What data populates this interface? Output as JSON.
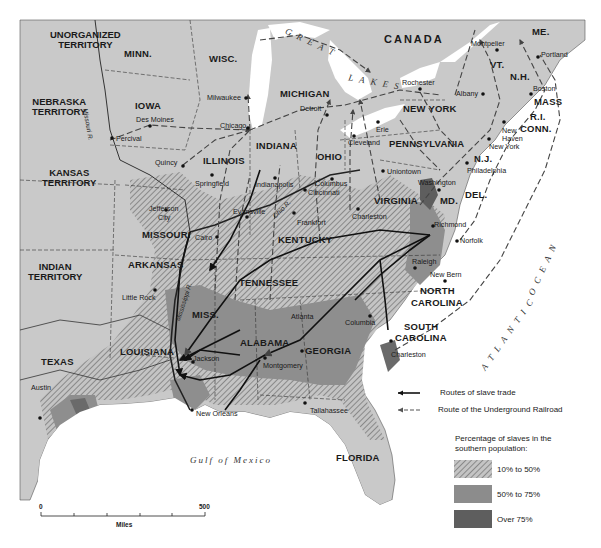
{
  "map": {
    "countries": {
      "canada": "CANADA"
    },
    "territories": {
      "unorganized": "UNORGANIZED\nTERRITORY",
      "nebraska": "NEBRASKA\nTERRITORY",
      "kansas": "KANSAS\nTERRITORY",
      "indian": "INDIAN\nTERRITORY"
    },
    "states": {
      "minn": "MINN.",
      "wisc": "WISC.",
      "iowa": "IOWA",
      "michigan": "MICHIGAN",
      "illinois": "ILLINOIS",
      "indiana": "INDIANA",
      "ohio": "OHIO",
      "new_york": "NEW YORK",
      "pennsylvania": "PENNSYLVANIA",
      "missouri": "MISSOURI",
      "kentucky": "KENTUCKY",
      "virginia": "VIRGINIA",
      "arkansas": "ARKANSAS",
      "tennessee": "TENNESSEE",
      "north_carolina_1": "NORTH",
      "north_carolina_2": "CAROLINA",
      "south_carolina_1": "SOUTH",
      "south_carolina_2": "CAROLINA",
      "miss": "MISS.",
      "alabama": "ALABAMA",
      "georgia": "GEORGIA",
      "louisiana": "LOUISIANA",
      "texas": "TEXAS",
      "florida": "FLORIDA",
      "me": "ME.",
      "vt": "VT.",
      "nh": "N.H.",
      "mass": "MASS",
      "ri": "R.I.",
      "conn": "CONN.",
      "nj": "N.J.",
      "del": "DEL.",
      "md": "MD."
    },
    "cities": {
      "milwaukee": "Milwaukee",
      "chicago": "Chicago",
      "des_moines": "Des Moines",
      "percival": "Percival",
      "quincy": "Quincy",
      "springfield": "Springfield",
      "indianapolis": "Indianapolis",
      "detroit": "Detroit",
      "cleveland": "Cleveland",
      "erie": "Erie",
      "rochester": "Rochester",
      "albany": "Albany",
      "montpelier": "Montpelier",
      "portland": "Portland",
      "boston": "Boston",
      "new_haven_1": "New",
      "new_haven_2": "Haven",
      "new_york": "New York",
      "philadelphia": "Philadelphia",
      "uniontown": "Uniontown",
      "columbus": "Columbus",
      "cincinnati": "Cincinnati",
      "washington": "Washington",
      "jefferson_city_1": "Jefferson",
      "jefferson_city_2": "City",
      "evansville": "Evansville",
      "frankfort": "Frankfort",
      "charleston_wv": "Charleston",
      "richmond": "Richmond",
      "norfolk": "Norfolk",
      "cairo": "Cairo",
      "raleigh": "Raleigh",
      "new_bern": "New Bern",
      "little_rock": "Little Rock",
      "atlanta": "Atlanta",
      "columbia": "Columbia",
      "jackson": "Jackson",
      "montgomery": "Montgomery",
      "charleston_sc": "Charleston",
      "austin": "Austin",
      "new_orleans": "New Orleans",
      "tallahassee": "Tallahassee"
    },
    "rivers": {
      "missouri": "Missouri R.",
      "mississippi": "Mississippi R.",
      "ohio": "Ohio R."
    },
    "water": {
      "great": "G R E A T",
      "lakes": "L A K E S",
      "atlantic": "A T L A N T I C",
      "ocean": "O C E A N",
      "gulf": "Gulf of Mexico"
    },
    "scale": {
      "start": "0",
      "end": "500",
      "unit": "Miles"
    }
  },
  "legend": {
    "slave_trade": "Routes of slave trade",
    "underground_railroad": "Route  of the Underground Railroad",
    "title": "Percentage of slaves in the\nsouthern population:",
    "items": [
      {
        "label": "10% to 50%",
        "color": "#a9a9a9"
      },
      {
        "label": "50% to 75%",
        "color": "#8c8c8c"
      },
      {
        "label": "Over 75%",
        "color": "#5e5e5e"
      }
    ]
  },
  "colors": {
    "land": "#c8c8c8",
    "water": "#ffffff",
    "route_solid": "#111111",
    "route_dashed": "#555555"
  }
}
